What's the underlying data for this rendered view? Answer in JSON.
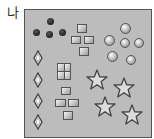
{
  "label": "나",
  "colors": {
    "box_fill": "#bcbcbc",
    "box_border": "#555555",
    "dot": "#2a2a2a"
  },
  "groups": {
    "dots": {
      "shape": "dark-dot",
      "count": 4
    },
    "squares_top": {
      "shape": "square",
      "count": 4
    },
    "spheres": {
      "shape": "sphere",
      "count": 6
    },
    "diamonds": {
      "shape": "diamond",
      "count": 4
    },
    "grid_square": {
      "shape": "2x2-square",
      "count": 1
    },
    "squares_bottom": {
      "shape": "square",
      "count": 4
    },
    "stars": {
      "shape": "star",
      "count": 4
    }
  }
}
